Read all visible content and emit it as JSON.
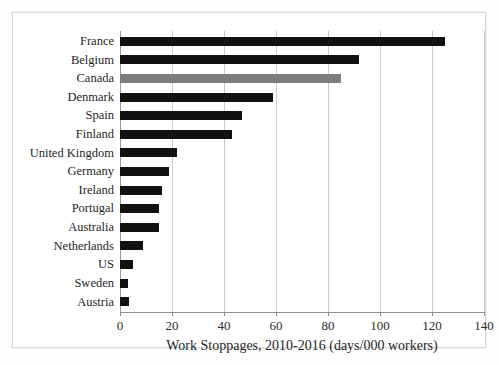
{
  "chart_data": {
    "type": "bar",
    "orientation": "horizontal",
    "title": "",
    "subtitle": "",
    "xlabel": "Work Stoppages, 2010-2016 (days/000 workers)",
    "ylabel": "",
    "xlim": [
      0,
      140
    ],
    "ylim": null,
    "xticks": [
      0,
      20,
      40,
      60,
      80,
      100,
      120,
      140
    ],
    "xtick_labels": [
      "0",
      "20",
      "40",
      "60",
      "80",
      "100",
      "120",
      "140"
    ],
    "grid": "vertical",
    "legend": null,
    "categories": [
      "France",
      "Belgium",
      "Canada",
      "Denmark",
      "Spain",
      "Finland",
      "United Kingdom",
      "Germany",
      "Ireland",
      "Portugal",
      "Australia",
      "Netherlands",
      "US",
      "Sweden",
      "Austria"
    ],
    "values": [
      125,
      92,
      85,
      59,
      47,
      43,
      22,
      19,
      16,
      15,
      15,
      9,
      5,
      3,
      3.5
    ],
    "bar_colors": [
      "#111111",
      "#111111",
      "#7d7d7d",
      "#111111",
      "#111111",
      "#111111",
      "#111111",
      "#111111",
      "#111111",
      "#111111",
      "#111111",
      "#111111",
      "#111111",
      "#111111",
      "#111111"
    ],
    "highlighted_category": "Canada",
    "colors": {
      "bar_default": "#111111",
      "bar_highlight": "#7d7d7d",
      "gridline": "#c9c9c9",
      "axis": "#8f8f8f",
      "text": "#1f1f1f",
      "background": "#ffffff",
      "frame": "#d8d8d8"
    }
  }
}
